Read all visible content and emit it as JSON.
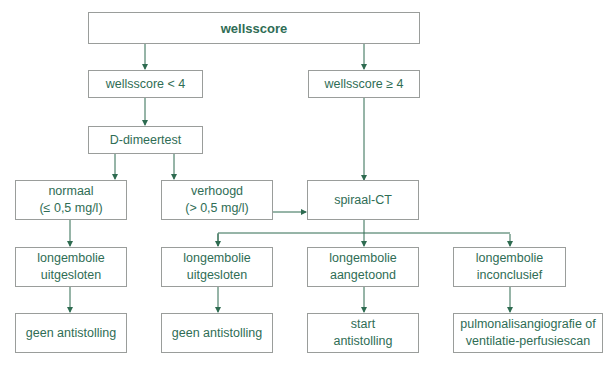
{
  "colors": {
    "text": "#2f6d55",
    "arrow": "#2e6b50",
    "border": "#9a9d9b"
  },
  "nodes": {
    "root": "wellsscore",
    "low": "wellsscore < 4",
    "high": "wellsscore ≥ 4",
    "ddimer": "D-dimeertest",
    "normal": "normaal\n(≤ 0,5 mg/l)",
    "elevated": "verhoogd\n(> 0,5 mg/l)",
    "ct": "spiraal-CT",
    "excluded_left": "longembolie\nuitgesloten",
    "excluded_mid": "longembolie\nuitgesloten",
    "confirmed": "longembolie\naangetoond",
    "inconclusive": "longembolie\ninconclusief",
    "no_anticoag_left": "geen antistolling",
    "no_anticoag_mid": "geen antistolling",
    "start_anticoag": "start\nantistolling",
    "further_imaging": "pulmonalisangiografie of\nventilatie-perfusiescan"
  }
}
